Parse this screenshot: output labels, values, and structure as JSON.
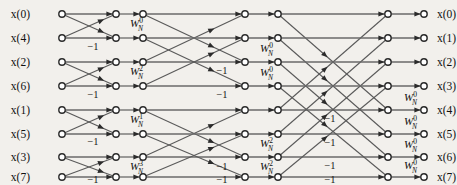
{
  "figure": {
    "kind": "fft-butterfly-signal-flow-graph",
    "title": "",
    "points": 8,
    "stages": 3,
    "colors": {
      "background": "#f2f0ec",
      "line": "#5a5a5a",
      "node_stroke": "#2b2b2b",
      "node_fill": "#ffffff",
      "text": "#111111"
    }
  },
  "rows": [
    {
      "index": 0,
      "y": 14
    },
    {
      "index": 1,
      "y": 38
    },
    {
      "index": 2,
      "y": 62
    },
    {
      "index": 3,
      "y": 86
    },
    {
      "index": 4,
      "y": 110
    },
    {
      "index": 5,
      "y": 134
    },
    {
      "index": 6,
      "y": 157
    },
    {
      "index": 7,
      "y": 177
    }
  ],
  "inputs": {
    "label_x": 30,
    "node_x": 62,
    "labels": [
      "x(0)",
      "x(4)",
      "x(2)",
      "x(6)",
      "x(1)",
      "x(5)",
      "x(3)",
      "x(7)"
    ]
  },
  "outputs": {
    "label_x": 437,
    "node_x": 424,
    "labels": [
      "x(0)",
      "x(1)",
      "x(2)",
      "x(3)",
      "x(4)",
      "x(5)",
      "x(6)",
      "x(7)"
    ]
  },
  "node_columns": [
    62,
    116,
    143,
    186,
    245,
    278,
    343,
    388,
    424
  ],
  "stage1": {
    "name": "stage-1",
    "span": 1,
    "from_x": 62,
    "to_x": 116,
    "pairs": [
      [
        0,
        1
      ],
      [
        2,
        3
      ],
      [
        4,
        5
      ],
      [
        6,
        7
      ]
    ],
    "minus_labels": [
      {
        "text": "−1",
        "x": 93,
        "y": 50
      },
      {
        "text": "−1",
        "x": 93,
        "y": 98
      },
      {
        "text": "−1",
        "x": 93,
        "y": 145
      },
      {
        "text": "−1",
        "x": 93,
        "y": 183
      }
    ]
  },
  "stage2": {
    "name": "stage-2",
    "span": 2,
    "from_x": 143,
    "to_x": 245,
    "twiddles": [
      {
        "row": 1,
        "base": "W",
        "sub": "N",
        "sup": "0",
        "x": 130,
        "y": 27
      },
      {
        "row": 3,
        "base": "W",
        "sub": "N",
        "sup": "2",
        "x": 130,
        "y": 75
      },
      {
        "row": 5,
        "base": "W",
        "sub": "N",
        "sup": "1",
        "x": 130,
        "y": 123
      },
      {
        "row": 7,
        "base": "W",
        "sub": "N",
        "sup": "3",
        "x": 130,
        "y": 170
      }
    ],
    "pairs": [
      [
        0,
        2
      ],
      [
        1,
        3
      ],
      [
        4,
        6
      ],
      [
        5,
        7
      ]
    ],
    "minus_labels": [
      {
        "text": "−1",
        "x": 222,
        "y": 74
      },
      {
        "text": "−1",
        "x": 222,
        "y": 98
      },
      {
        "text": "−1",
        "x": 222,
        "y": 170
      },
      {
        "text": "−1",
        "x": 222,
        "y": 183
      }
    ]
  },
  "stage3": {
    "name": "stage-3",
    "span": 4,
    "from_x": 278,
    "to_x": 388,
    "twiddles": [
      {
        "row": 2,
        "base": "W",
        "sub": "N",
        "sup": "0",
        "x": 260,
        "y": 52
      },
      {
        "row": 3,
        "base": "W",
        "sub": "N",
        "sup": "0",
        "x": 260,
        "y": 76
      },
      {
        "row": 6,
        "base": "W",
        "sub": "N",
        "sup": "2",
        "x": 260,
        "y": 147
      },
      {
        "row": 7,
        "base": "W",
        "sub": "N",
        "sup": "2",
        "x": 260,
        "y": 170
      }
    ],
    "pairs": [
      [
        0,
        4
      ],
      [
        1,
        5
      ],
      [
        2,
        6
      ],
      [
        3,
        7
      ]
    ],
    "minus_labels": [
      {
        "text": "−1",
        "x": 330,
        "y": 122
      },
      {
        "text": "−1",
        "x": 330,
        "y": 146
      },
      {
        "text": "−1",
        "x": 330,
        "y": 169
      },
      {
        "text": "−1",
        "x": 330,
        "y": 183
      }
    ]
  },
  "stage4_twiddles": {
    "name": "output-twiddles",
    "items": [
      {
        "row": 4,
        "base": "W",
        "sub": "N",
        "sup": "0",
        "x": 404,
        "y": 101
      },
      {
        "row": 5,
        "base": "W",
        "sub": "N",
        "sup": "0",
        "x": 404,
        "y": 125
      },
      {
        "row": 6,
        "base": "W",
        "sub": "N",
        "sup": "0",
        "x": 404,
        "y": 148
      },
      {
        "row": 7,
        "base": "W",
        "sub": "N",
        "sup": "0",
        "x": 404,
        "y": 169
      }
    ]
  }
}
